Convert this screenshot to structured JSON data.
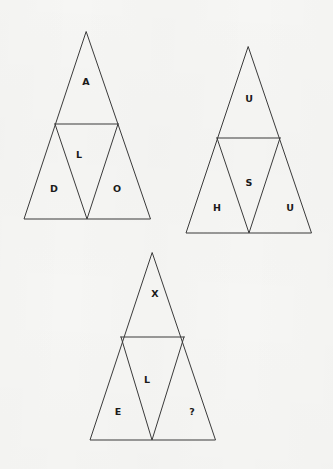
{
  "page": {
    "background_color": "#f6f6f4",
    "line_color": "#3b3b3b",
    "text_color": "#1a1a1a",
    "width": 333,
    "height": 469
  },
  "figures": [
    {
      "id": "triangle-1",
      "word": "ADOL",
      "apex": {
        "x": 86,
        "y": 32
      },
      "base_left": {
        "x": 24,
        "y": 219
      },
      "base_right": {
        "x": 150,
        "y": 219
      },
      "divider_left": {
        "x": 55,
        "y": 124
      },
      "divider_right": {
        "x": 118,
        "y": 124
      },
      "base_mid": {
        "x": 87,
        "y": 219
      },
      "cells": [
        {
          "name": "top",
          "letter": "A",
          "x": 86,
          "y": 82
        },
        {
          "name": "middle",
          "letter": "L",
          "x": 79,
          "y": 155
        },
        {
          "name": "bottom-left",
          "letter": "D",
          "x": 54,
          "y": 189
        },
        {
          "name": "bottom-right",
          "letter": "O",
          "x": 117,
          "y": 189
        }
      ]
    },
    {
      "id": "triangle-2",
      "word": "USHU",
      "apex": {
        "x": 248,
        "y": 47
      },
      "base_left": {
        "x": 186,
        "y": 233
      },
      "base_right": {
        "x": 311,
        "y": 233
      },
      "divider_left": {
        "x": 217,
        "y": 138
      },
      "divider_right": {
        "x": 280,
        "y": 138
      },
      "base_mid": {
        "x": 249,
        "y": 233
      },
      "cells": [
        {
          "name": "top",
          "letter": "U",
          "x": 249,
          "y": 99
        },
        {
          "name": "middle",
          "letter": "S",
          "x": 249,
          "y": 183
        },
        {
          "name": "bottom-left",
          "letter": "H",
          "x": 217,
          "y": 208
        },
        {
          "name": "bottom-right",
          "letter": "U",
          "x": 290,
          "y": 208
        }
      ]
    },
    {
      "id": "triangle-3",
      "word": "XLE?",
      "apex": {
        "x": 152,
        "y": 253
      },
      "base_left": {
        "x": 90,
        "y": 440
      },
      "base_right": {
        "x": 215,
        "y": 440
      },
      "divider_left": {
        "x": 121,
        "y": 337
      },
      "divider_right": {
        "x": 184,
        "y": 337
      },
      "base_mid": {
        "x": 152,
        "y": 440
      },
      "cells": [
        {
          "name": "top",
          "letter": "X",
          "x": 155,
          "y": 294
        },
        {
          "name": "middle",
          "letter": "L",
          "x": 147,
          "y": 380
        },
        {
          "name": "bottom-left",
          "letter": "E",
          "x": 118,
          "y": 412
        },
        {
          "name": "bottom-right",
          "letter": "?",
          "x": 192,
          "y": 412
        }
      ]
    }
  ]
}
